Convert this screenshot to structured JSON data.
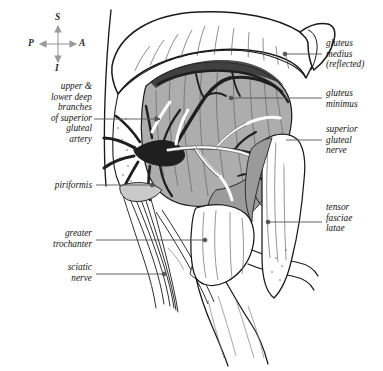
{
  "figure": {
    "background": "#ffffff",
    "ink": "#1a1a1a",
    "muscle_gray": "#adadad",
    "muscle_gray_dark": "#8e8e8e",
    "vessel_dark": "#262626",
    "leader_color": "#555555"
  },
  "orientation": {
    "name": "orientation-compass",
    "superior": "S",
    "inferior": "I",
    "anterior": "A",
    "posterior": "P"
  },
  "labels": {
    "left": [
      {
        "id": "superior-gluteal-artery",
        "text": "upper &\nlower deep\nbranches\nof superior\ngluteal\nartery",
        "x": 8,
        "y": 81,
        "width": 84,
        "leader": {
          "x1": 94,
          "y1": 119,
          "x2": 160,
          "y2": 119,
          "dot": false,
          "arrow": true
        }
      },
      {
        "id": "piriformis",
        "text": "piriformis",
        "x": 18,
        "y": 180,
        "width": 74,
        "leader": {
          "x1": 96,
          "y1": 185,
          "x2": 152,
          "y2": 185,
          "dot": true,
          "arrow": false
        }
      },
      {
        "id": "greater-trochanter",
        "text": "greater\ntrochanter",
        "x": 16,
        "y": 228,
        "width": 76,
        "leader": {
          "x1": 96,
          "y1": 240,
          "x2": 205,
          "y2": 240,
          "dot": true,
          "arrow": false
        }
      },
      {
        "id": "sciatic-nerve",
        "text": "sciatic\nnerve",
        "x": 28,
        "y": 262,
        "width": 64,
        "leader": {
          "x1": 96,
          "y1": 274,
          "x2": 164,
          "y2": 274,
          "dot": true,
          "arrow": false
        }
      }
    ],
    "right": [
      {
        "id": "gluteus-medius-reflected",
        "text": "gluteus\nmedius\n(reflected)",
        "x": 326,
        "y": 38,
        "width": 58,
        "leader": {
          "x1": 322,
          "y1": 54,
          "x2": 285,
          "y2": 54,
          "dot": true,
          "arrow": false
        }
      },
      {
        "id": "gluteus-minimus",
        "text": "gluteus\nminimus",
        "x": 326,
        "y": 88,
        "width": 58,
        "leader": {
          "x1": 322,
          "y1": 98,
          "x2": 231,
          "y2": 98,
          "dot": true,
          "arrow": false
        }
      },
      {
        "id": "superior-gluteal-nerve",
        "text": "superior\ngluteal\nnerve",
        "x": 326,
        "y": 124,
        "width": 58,
        "leader": {
          "x1": 322,
          "y1": 140,
          "x2": 286,
          "y2": 140,
          "dot": false,
          "arrow": false
        }
      },
      {
        "id": "tensor-fasciae-latae",
        "text": "tensor\nfasciae\nlatae",
        "x": 326,
        "y": 202,
        "width": 58,
        "leader": {
          "x1": 322,
          "y1": 222,
          "x2": 268,
          "y2": 222,
          "dot": true,
          "arrow": false
        }
      }
    ]
  }
}
